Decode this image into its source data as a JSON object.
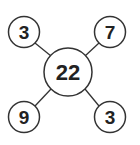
{
  "diagram": {
    "center": {
      "value": "22"
    },
    "nodes": [
      {
        "position": "top-left",
        "value": "3"
      },
      {
        "position": "top-right",
        "value": "7"
      },
      {
        "position": "bottom-left",
        "value": "9"
      },
      {
        "position": "bottom-right",
        "value": "3"
      }
    ],
    "colors": {
      "stroke": "#333333",
      "text": "#222222",
      "background": "#ffffff"
    }
  }
}
